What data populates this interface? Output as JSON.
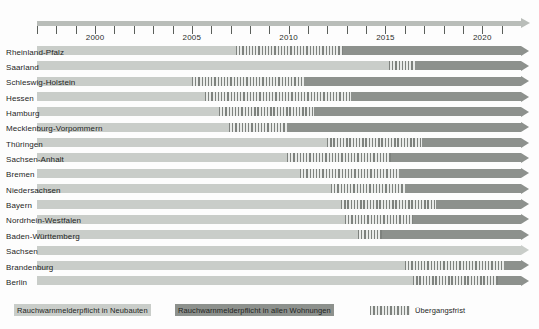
{
  "chart_data": {
    "type": "bar",
    "title": "",
    "xlabel": "",
    "ylabel": "",
    "orientation": "horizontal",
    "grid": false,
    "axis": {
      "min_year": 1997,
      "max_year": 2022,
      "tick_years": [
        1997,
        1998,
        1999,
        2000,
        2001,
        2002,
        2003,
        2004,
        2005,
        2006,
        2007,
        2008,
        2009,
        2010,
        2011,
        2012,
        2013,
        2014,
        2015,
        2016,
        2017,
        2018,
        2019,
        2020,
        2021
      ],
      "labeled_ticks": [
        {
          "year": 2000,
          "label": "2000"
        },
        {
          "year": 2005,
          "label": "2005"
        },
        {
          "year": 2010,
          "label": "2010"
        },
        {
          "year": 2015,
          "label": "2015"
        },
        {
          "year": 2020,
          "label": "2020"
        }
      ]
    },
    "categories": [
      "Rheinland-Pfalz",
      "Saarland",
      "Schleswig-Holstein",
      "Hessen",
      "Hamburg",
      "Mecklenburg-Vorpommern",
      "Thüringen",
      "Sachsen-Anhalt",
      "Bremen",
      "Niedersachsen",
      "Bayern",
      "Nordrhein-Westfalen",
      "Baden-Württemberg",
      "Sachsen",
      "Brandenburg",
      "Berlin"
    ],
    "series": [
      {
        "name": "Rauchwarnmelderpflicht in Neubauten",
        "key": "neubauten",
        "color": "#c9cdc9",
        "values": [
          2007.3,
          2015.2,
          2005.0,
          2005.7,
          2006.4,
          2006.9,
          2012.0,
          2009.9,
          2010.6,
          2012.2,
          2012.7,
          2012.9,
          2013.6,
          null,
          2016.0,
          2016.4
        ]
      },
      {
        "name": "Übergangsfrist",
        "key": "uebergangsfrist",
        "color": "#7e827e",
        "values": [
          2012.8,
          2016.5,
          2010.8,
          2013.2,
          2011.3,
          2009.9,
          2016.9,
          2015.3,
          2015.7,
          2016.0,
          2017.6,
          2016.4,
          2014.8,
          null,
          2021.1,
          2020.8
        ]
      },
      {
        "name": "Rauchwarnmelderpflicht in allen Wohnungen",
        "key": "alle_wohnungen",
        "color": "#8d918d",
        "values": [
          2022,
          2022,
          2022,
          2022,
          2022,
          2022,
          2022,
          2022,
          2022,
          2022,
          2022,
          2022,
          2022,
          null,
          2022,
          2022
        ]
      }
    ],
    "rows": [
      {
        "label": "Rheinland-Pfalz",
        "light_start": 1997,
        "hatch_start": 2007.3,
        "dark_start": 2012.8,
        "end": 2022
      },
      {
        "label": "Saarland",
        "light_start": 1997,
        "hatch_start": 2015.2,
        "dark_start": 2016.5,
        "end": 2022
      },
      {
        "label": "Schleswig-Holstein",
        "light_start": 1997,
        "hatch_start": 2005.0,
        "dark_start": 2010.8,
        "end": 2022
      },
      {
        "label": "Hessen",
        "light_start": 1997,
        "hatch_start": 2005.7,
        "dark_start": 2013.2,
        "end": 2022
      },
      {
        "label": "Hamburg",
        "light_start": 1997,
        "hatch_start": 2006.4,
        "dark_start": 2011.3,
        "end": 2022
      },
      {
        "label": "Mecklenburg-Vorpommern",
        "light_start": 1997,
        "hatch_start": 2006.9,
        "dark_start": 2009.9,
        "end": 2022
      },
      {
        "label": "Thüringen",
        "light_start": 1997,
        "hatch_start": 2012.0,
        "dark_start": 2016.9,
        "end": 2022
      },
      {
        "label": "Sachsen-Anhalt",
        "light_start": 1997,
        "hatch_start": 2009.9,
        "dark_start": 2015.3,
        "end": 2022
      },
      {
        "label": "Bremen",
        "light_start": 1997,
        "hatch_start": 2010.6,
        "dark_start": 2015.7,
        "end": 2022
      },
      {
        "label": "Niedersachsen",
        "light_start": 1997,
        "hatch_start": 2012.2,
        "dark_start": 2016.0,
        "end": 2022
      },
      {
        "label": "Bayern",
        "light_start": 1997,
        "hatch_start": 2012.7,
        "dark_start": 2017.6,
        "end": 2022
      },
      {
        "label": "Nordrhein-Westfalen",
        "light_start": 1997,
        "hatch_start": 2012.9,
        "dark_start": 2016.4,
        "end": 2022
      },
      {
        "label": "Baden-Württemberg",
        "light_start": 1997,
        "hatch_start": 2013.6,
        "dark_start": 2014.8,
        "end": 2022
      },
      {
        "label": "Sachsen",
        "light_start": 1997,
        "hatch_start": null,
        "dark_start": null,
        "end": 2022
      },
      {
        "label": "Brandenburg",
        "light_start": 1997,
        "hatch_start": 2016.0,
        "dark_start": 2021.1,
        "end": 2022
      },
      {
        "label": "Berlin",
        "light_start": 1997,
        "hatch_start": 2016.4,
        "dark_start": 2020.8,
        "end": 2022
      }
    ],
    "legend": {
      "position": "bottom-left",
      "entries": [
        {
          "label": "Rauchwarnmelderpflicht in Neubauten",
          "style": "light",
          "color": "#c9cdc9"
        },
        {
          "label": "Rauchwarnmelderpflicht in allen Wohnungen",
          "style": "dark",
          "color": "#8d918d"
        },
        {
          "label": "Übergangsfrist",
          "style": "hatch",
          "color": "#7e827e"
        }
      ]
    },
    "colors": {
      "light": "#c9cdc9",
      "dark": "#8d918d",
      "hatch": "#7e827e",
      "axis": "#b9bdb9",
      "tick": "#5b5f5b",
      "text": "#1d1f1d",
      "background": "#fdfdfd"
    }
  }
}
